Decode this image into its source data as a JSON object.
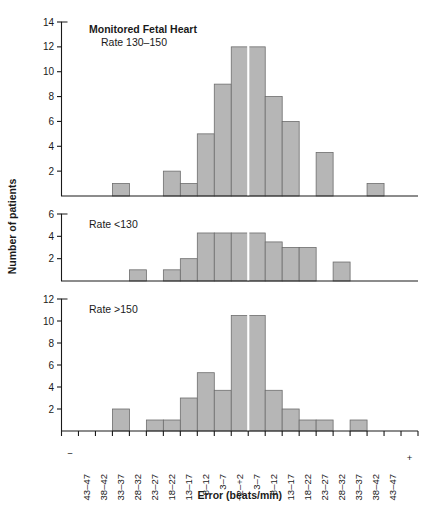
{
  "figure": {
    "y_axis_label": "Number of patients",
    "x_axis_label": "Error (beats/min)",
    "bar_color": "#b6b6b6",
    "bar_border_color": "#6d6d6d",
    "axis_color": "#1a1a1a",
    "background_color": "#ffffff"
  },
  "chart_data": {
    "type": "bar",
    "xlabel": "Error (beats/min)",
    "ylabel": "Number of patients",
    "grid": false,
    "legend": "none",
    "orientation": "vertical",
    "categories": [
      "43–47",
      "38–42",
      "33–37",
      "28–32",
      "23–27",
      "18–22",
      "13–17",
      "8–12",
      "3–7",
      "−2–+2",
      "3–7",
      "8–12",
      "13–17",
      "18–22",
      "23–27",
      "28–32",
      "33–37",
      "38–42",
      "43–47"
    ],
    "axis_end_labels": {
      "left": "−",
      "right": "+"
    },
    "panels": [
      {
        "name": "panel-rate-130-150",
        "title_bold": "Monitored Fetal Heart",
        "title_plain": "Rate 130–150",
        "ylim": [
          0,
          14
        ],
        "yticks": [
          2,
          4,
          6,
          8,
          10,
          12,
          14
        ],
        "values": [
          0,
          0,
          1,
          0,
          0,
          2,
          1,
          5,
          9,
          12,
          12,
          8,
          6,
          0,
          3.5,
          0,
          0,
          1,
          0
        ]
      },
      {
        "name": "panel-rate-under-130",
        "title_bold": "",
        "title_plain": "Rate <130",
        "ylim": [
          0,
          6
        ],
        "yticks": [
          2,
          4,
          6
        ],
        "values": [
          0,
          0,
          0,
          1,
          0,
          1,
          2,
          4.3,
          4.3,
          4.3,
          4.3,
          3.5,
          3,
          3,
          0,
          1.7,
          0,
          0,
          0
        ]
      },
      {
        "name": "panel-rate-over-150",
        "title_bold": "",
        "title_plain": "Rate >150",
        "ylim": [
          0,
          12
        ],
        "yticks": [
          2,
          4,
          6,
          8,
          10,
          12
        ],
        "values": [
          0,
          0,
          2,
          0,
          1,
          1,
          3,
          5.3,
          3.7,
          10.5,
          10.5,
          3.7,
          2,
          1,
          1,
          0,
          1,
          0,
          0
        ]
      }
    ]
  }
}
